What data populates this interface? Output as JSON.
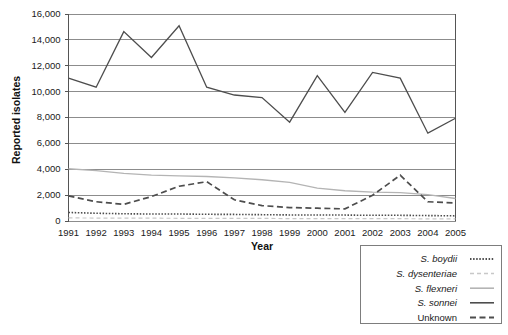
{
  "chart_data": {
    "type": "line",
    "title": "",
    "xlabel": "Year",
    "ylabel": "Reported isolates",
    "x": [
      1991,
      1992,
      1993,
      1994,
      1995,
      1996,
      1997,
      1998,
      1999,
      2000,
      2001,
      2002,
      2003,
      2004,
      2005
    ],
    "categories": [
      "1991",
      "1992",
      "1993",
      "1994",
      "1995",
      "1996",
      "1997",
      "1998",
      "1999",
      "2000",
      "2001",
      "2002",
      "2003",
      "2004",
      "2005"
    ],
    "xlim": [
      1991,
      2005
    ],
    "ylim": [
      0,
      16000
    ],
    "yticks": [
      0,
      2000,
      4000,
      6000,
      8000,
      10000,
      12000,
      14000,
      16000
    ],
    "ytick_labels": [
      "0",
      "2,000",
      "4,000",
      "6,000",
      "8,000",
      "10,000",
      "12,000",
      "14,000",
      "16,000"
    ],
    "grid": "horizontal",
    "legend_position": "bottom-right",
    "series": [
      {
        "name": "S. boydii",
        "italic": true,
        "style": "dotted",
        "color": "#4d4d4d",
        "dash": "1.5,1.6",
        "width": 1.6,
        "values": [
          620,
          560,
          520,
          500,
          500,
          480,
          470,
          450,
          430,
          430,
          420,
          400,
          400,
          380,
          360
        ]
      },
      {
        "name": "S. dysenteriae",
        "italic": true,
        "style": "light-dashed",
        "color": "#c8c8c8",
        "dash": "4,3",
        "width": 1.2,
        "values": [
          200,
          190,
          180,
          180,
          170,
          170,
          160,
          160,
          150,
          150,
          150,
          140,
          140,
          130,
          130
        ]
      },
      {
        "name": "S.  flexneri",
        "italic": true,
        "style": "light-solid",
        "color": "#b4b4b4",
        "dash": "",
        "width": 1.3,
        "values": [
          4000,
          3850,
          3650,
          3500,
          3450,
          3400,
          3300,
          3150,
          2950,
          2500,
          2300,
          2200,
          2150,
          2000,
          1700
        ]
      },
      {
        "name": "S. sonnei",
        "italic": true,
        "style": "solid",
        "color": "#4d4d4d",
        "dash": "",
        "width": 1.3,
        "values": [
          11000,
          10300,
          14600,
          12600,
          15050,
          10300,
          9700,
          9500,
          7600,
          11200,
          8350,
          11450,
          11000,
          6750,
          7900
        ]
      },
      {
        "name": "Unknown",
        "italic": false,
        "style": "dashed",
        "color": "#4d4d4d",
        "dash": "6,3.5",
        "width": 1.7,
        "values": [
          1900,
          1450,
          1250,
          1850,
          2650,
          3000,
          1600,
          1150,
          1000,
          950,
          900,
          1950,
          3500,
          1450,
          1350
        ]
      }
    ]
  },
  "legend": {
    "items": [
      {
        "label": "S. boydii"
      },
      {
        "label": "S. dysenteriae"
      },
      {
        "label": "S.  flexneri"
      },
      {
        "label": "S. sonnei"
      },
      {
        "label": "Unknown"
      }
    ]
  }
}
